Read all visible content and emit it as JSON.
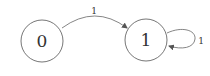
{
  "diagram": {
    "type": "state-diagram",
    "nodes": [
      {
        "id": "0",
        "label": "0"
      },
      {
        "id": "1",
        "label": "1"
      }
    ],
    "edges": [
      {
        "from": "0",
        "to": "1",
        "label": "1"
      },
      {
        "from": "1",
        "to": "1",
        "label": "1"
      }
    ],
    "colors": {
      "stroke": "#555555",
      "text": "#333333",
      "background": "#ffffff"
    }
  }
}
